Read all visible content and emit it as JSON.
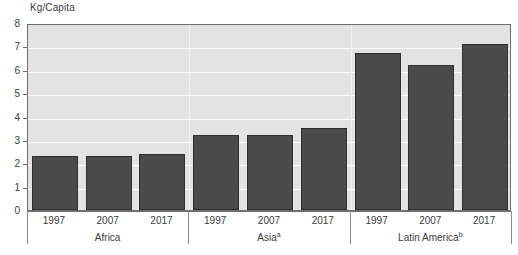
{
  "chart_data": {
    "type": "bar",
    "title": "",
    "xlabel": "",
    "ylabel": "Kg/Capita",
    "ylim": [
      0,
      8
    ],
    "ytick_labels": [
      "0",
      "1",
      "2",
      "3",
      "4",
      "5",
      "6",
      "7",
      "8"
    ],
    "ytick_values": [
      0,
      1,
      2,
      3,
      4,
      5,
      6,
      7,
      8
    ],
    "grid": true,
    "legend": "none",
    "categories": [
      "1997",
      "2007",
      "2017",
      "1997",
      "2007",
      "2017",
      "1997",
      "2007",
      "2017"
    ],
    "values": [
      2.3,
      2.3,
      2.4,
      3.2,
      3.2,
      3.5,
      6.7,
      6.2,
      7.1
    ],
    "groups": [
      {
        "name": "Africa",
        "footnote_marker": "",
        "points": [
          {
            "year": "1997",
            "value": 2.3
          },
          {
            "year": "2007",
            "value": 2.3
          },
          {
            "year": "2017",
            "value": 2.4
          }
        ]
      },
      {
        "name": "Asia",
        "footnote_marker": "a",
        "points": [
          {
            "year": "1997",
            "value": 3.2
          },
          {
            "year": "2007",
            "value": 3.2
          },
          {
            "year": "2017",
            "value": 3.5
          }
        ]
      },
      {
        "name": "Latin America",
        "footnote_marker": "b",
        "points": [
          {
            "year": "1997",
            "value": 6.7
          },
          {
            "year": "2007",
            "value": 6.2
          },
          {
            "year": "2017",
            "value": 7.1
          }
        ]
      }
    ],
    "colors": {
      "bar_fill": "#4a4a4a",
      "bar_edge": "#2f2f2f",
      "plot_background": "#e3e3e3",
      "gridline": "#fbfbfb",
      "axis": "#6e6e6e",
      "text": "#3c3c3c"
    }
  }
}
